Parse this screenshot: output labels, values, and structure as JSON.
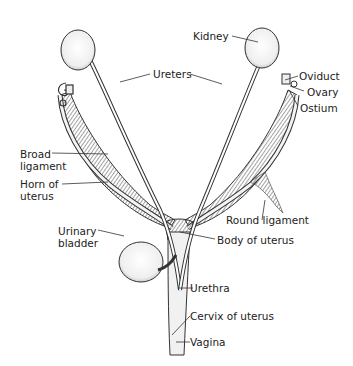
{
  "diagram": {
    "labels": {
      "kidney": "Kidney",
      "oviduct": "Oviduct",
      "ovary": "Ovary",
      "ostium": "Ostium",
      "ureters": "Ureters",
      "broad_ligament_1": "Broad",
      "broad_ligament_2": "ligament",
      "horn_1": "Horn of",
      "horn_2": "uterus",
      "round_ligament": "Round ligament",
      "bladder_1": "Urinary",
      "bladder_2": "bladder",
      "body_of_uterus": "Body of uterus",
      "urethra": "Urethra",
      "cervix": "Cervix of uterus",
      "vagina": "Vagina"
    },
    "colors": {
      "ink": "#222222",
      "organ_fill": "#f4f4f4",
      "hatch": "#6e6e6e",
      "background": "#ffffff"
    }
  }
}
